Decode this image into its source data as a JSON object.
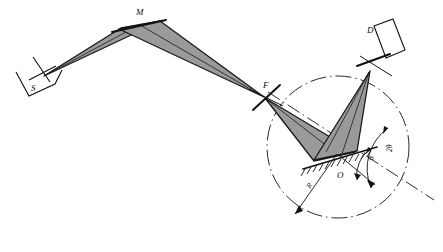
{
  "figure": {
    "kind": "optical-ray-diagram",
    "background_color": "#ffffff",
    "ink_color": "#111111",
    "beam_fill_color": "#9a9a9a",
    "beam_edge_color": "#1a1a1a"
  },
  "labels": {
    "source": "S",
    "monochromator": "M",
    "focus": "F",
    "sample_origin": "O",
    "detector": "D",
    "radius": "R",
    "theta": "θ",
    "two_theta": "2θ"
  },
  "components": {
    "source": {
      "name": "S",
      "description": "x-ray tube focal spot with slit housing",
      "x": 38,
      "y": 74
    },
    "monochromator": {
      "name": "M",
      "description": "curved crystal monochromator apex",
      "x": 140,
      "y": 22
    },
    "focus": {
      "name": "F",
      "description": "focal point / receiving slit on goniometer circle",
      "x": 265,
      "y": 97
    },
    "sample": {
      "name": "O",
      "description": "flat hatched specimen surface at goniometer centre",
      "x": 341,
      "y": 158
    },
    "detector": {
      "name": "D",
      "description": "detector with receiving slit on focusing circle",
      "x": 381,
      "y": 38
    }
  },
  "geometry": {
    "circle": {
      "label": "goniometer circle",
      "center_x": 338,
      "center_y": 147,
      "radius": 71,
      "stroke_style": "dashed"
    },
    "radius_arrow": {
      "label": "R",
      "from_x": 336,
      "from_y": 155,
      "to_x": 294,
      "to_y": 215
    },
    "angles": [
      {
        "name": "θ",
        "value_label": "θ",
        "arc_radius": 28,
        "description": "incidence angle between sample surface and reference axis"
      },
      {
        "name": "2θ",
        "value_label": "2θ",
        "arc_radius": 49,
        "description": "scattering angle between transmitted axis and detector arm"
      }
    ]
  },
  "beams": [
    {
      "name": "source-to-monochromator",
      "from": "S",
      "to": "M",
      "filled": true
    },
    {
      "name": "monochromator-to-focus",
      "from": "M",
      "to": "F",
      "filled": true
    },
    {
      "name": "focus-to-sample",
      "from": "F",
      "to": "O",
      "filled": true
    },
    {
      "name": "sample-to-detector",
      "from": "O",
      "to": "D",
      "filled": true
    }
  ]
}
